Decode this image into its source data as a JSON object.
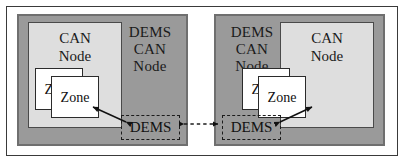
{
  "diagram": {
    "colors": {
      "node_fill": "#9a9a9a",
      "node_border": "#6f6f6f",
      "can_fill": "#dedede",
      "can_border": "#4a4a4a",
      "zone_fill": "#ffffff",
      "zone_border": "#2b2b2b",
      "line": "#1c1c1c",
      "frame": "#3a3a3a",
      "background": "#ffffff"
    },
    "nodes": [
      {
        "id": "left-node",
        "side": "left",
        "title_lines": [
          "DEMS",
          "CAN",
          "Node"
        ],
        "can_title_lines": [
          "CAN",
          "Node"
        ],
        "zones": [
          {
            "id": "zone-back",
            "label": "Zone"
          },
          {
            "id": "zone-front",
            "label": "Zone"
          }
        ],
        "dems_box_label": "DEMS"
      },
      {
        "id": "right-node",
        "side": "right",
        "title_lines": [
          "DEMS",
          "CAN",
          "Node"
        ],
        "can_title_lines": [
          "CAN",
          "Node"
        ],
        "zones": [
          {
            "id": "zone-back",
            "label": "Zone"
          },
          {
            "id": "zone-front",
            "label": "Zone"
          }
        ],
        "dems_box_label": "DEMS"
      }
    ],
    "connectors": [
      {
        "id": "inter-node-link",
        "style": "dashed",
        "arrowheads": "both",
        "from": "left-node.dems-box",
        "to": "right-node.dems-box"
      },
      {
        "id": "left-dems-to-zone",
        "style": "solid",
        "arrowheads": "both",
        "from": "left-node.dems-box",
        "to": "left-node.zone-front"
      },
      {
        "id": "right-dems-to-zone",
        "style": "solid",
        "arrowheads": "both",
        "from": "right-node.dems-box",
        "to": "right-node.zone-back"
      }
    ]
  }
}
